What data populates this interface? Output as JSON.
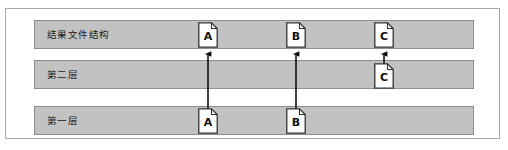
{
  "figure": {
    "background_color": "#ffffff",
    "frame_border_color": "#a9a9a9",
    "bar_fill_color": "#c2c2c2",
    "bar_border_color": "#8d8d8d",
    "arrow_color": "#111111",
    "doc_fill_color": "#ffffff",
    "doc_border_color": "#333333"
  },
  "layers": [
    {
      "id": "layer-result",
      "label": "结果文件结构",
      "row": 1,
      "documents": [
        {
          "id": "result-a",
          "letter": "A",
          "x": 198
        },
        {
          "id": "result-b",
          "letter": "B",
          "x": 286
        },
        {
          "id": "result-c",
          "letter": "C",
          "x": 374
        }
      ]
    },
    {
      "id": "layer-second",
      "label": "第二层",
      "row": 2,
      "documents": [
        {
          "id": "second-c",
          "letter": "C",
          "x": 374
        }
      ]
    },
    {
      "id": "layer-first",
      "label": "第一层",
      "row": 3,
      "documents": [
        {
          "id": "first-a",
          "letter": "A",
          "x": 198
        },
        {
          "id": "first-b",
          "letter": "B",
          "x": 286
        }
      ]
    }
  ],
  "connectors": [
    {
      "id": "arrow-a",
      "letter": "A",
      "from_layer": "第一层",
      "to_layer": "结果文件结构",
      "x": 208,
      "y_start": 106,
      "y_end": 51
    },
    {
      "id": "arrow-b",
      "letter": "B",
      "from_layer": "第一层",
      "to_layer": "结果文件结构",
      "x": 296,
      "y_start": 106,
      "y_end": 51
    },
    {
      "id": "arrow-c",
      "letter": "C",
      "from_layer": "第二层",
      "to_layer": "结果文件结构",
      "x": 384,
      "y_start": 62,
      "y_end": 51
    }
  ]
}
